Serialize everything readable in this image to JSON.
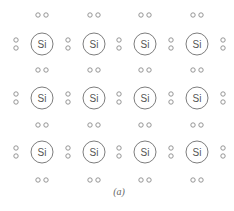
{
  "diagram": {
    "caption": "(a)",
    "element_symbol": "Si",
    "rows": 3,
    "cols": 4,
    "colors": {
      "atom_stroke": "#6e6e6e",
      "electron_stroke": "#8a8a8a",
      "label": "#555555",
      "caption": "#666666",
      "background": "#ffffff"
    },
    "atoms": [
      {
        "row": 0,
        "col": 0,
        "label": "Si"
      },
      {
        "row": 0,
        "col": 1,
        "label": "Si"
      },
      {
        "row": 0,
        "col": 2,
        "label": "Si"
      },
      {
        "row": 0,
        "col": 3,
        "label": "Si"
      },
      {
        "row": 1,
        "col": 0,
        "label": "Si"
      },
      {
        "row": 1,
        "col": 1,
        "label": "Si"
      },
      {
        "row": 1,
        "col": 2,
        "label": "Si"
      },
      {
        "row": 1,
        "col": 3,
        "label": "Si"
      },
      {
        "row": 2,
        "col": 0,
        "label": "Si"
      },
      {
        "row": 2,
        "col": 1,
        "label": "Si"
      },
      {
        "row": 2,
        "col": 2,
        "label": "Si"
      },
      {
        "row": 2,
        "col": 3,
        "label": "Si"
      }
    ],
    "layout": {
      "atom_x": [
        42,
        94,
        145,
        197
      ],
      "atom_y": [
        44,
        98,
        152
      ],
      "atom_radius": 11,
      "horizontal_pair_y": [
        15,
        70,
        125,
        180
      ],
      "horizontal_pair_dx": 4,
      "vertical_pair_x": [
        16,
        68,
        119,
        171,
        223
      ],
      "vertical_pair_dy": 4,
      "electron_radius": 2.2,
      "caption_x": 119,
      "caption_y": 195
    }
  }
}
